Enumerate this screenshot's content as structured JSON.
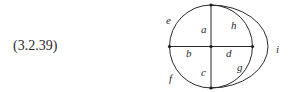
{
  "equation": {
    "label": "(3.2.39)"
  },
  "graph": {
    "description": "Planar graph: circle with a cross (vertical and horizontal diameters) and an extra outer arc joining top and bottom vertices on the right",
    "vertices": [
      {
        "id": "top",
        "x": 211,
        "y": 5
      },
      {
        "id": "bottom",
        "x": 211,
        "y": 88
      },
      {
        "id": "left",
        "x": 170,
        "y": 46.5
      },
      {
        "id": "right",
        "x": 252,
        "y": 46.5
      },
      {
        "id": "center",
        "x": 211,
        "y": 46.5
      }
    ],
    "edges": [
      {
        "label": "a",
        "from": "top",
        "to": "center",
        "kind": "line"
      },
      {
        "label": "b",
        "from": "left",
        "to": "center",
        "kind": "line"
      },
      {
        "label": "c",
        "from": "center",
        "to": "bottom",
        "kind": "line"
      },
      {
        "label": "d",
        "from": "center",
        "to": "right",
        "kind": "line"
      },
      {
        "label": "e",
        "from": "top",
        "to": "left",
        "kind": "circle-arc"
      },
      {
        "label": "f",
        "from": "left",
        "to": "bottom",
        "kind": "circle-arc"
      },
      {
        "label": "g",
        "from": "right",
        "to": "bottom",
        "kind": "circle-arc"
      },
      {
        "label": "h",
        "from": "top",
        "to": "right",
        "kind": "circle-arc"
      },
      {
        "label": "i",
        "from": "top",
        "to": "bottom",
        "kind": "outer-arc"
      }
    ],
    "labels": {
      "a": "a",
      "b": "b",
      "c": "c",
      "d": "d",
      "e": "e",
      "f": "f",
      "g": "g",
      "h": "h",
      "i": "i"
    }
  }
}
